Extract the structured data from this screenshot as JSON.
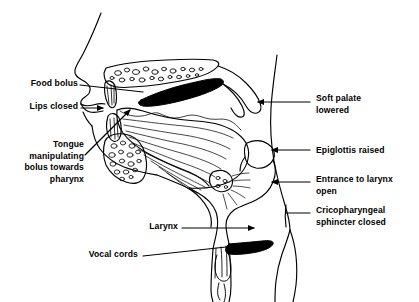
{
  "diagram": {
    "type": "anatomical-line-drawing",
    "view": "midsagittal (side profile, facing left)",
    "stroke_color": "#000000",
    "fill_color": "#000000",
    "background_color": "#ffffff"
  },
  "labels": {
    "food_bolus": "Food bolus",
    "lips_closed": "Lips closed",
    "tongue": "Tongue\nmanipulating\nbolus towards\npharynx",
    "larynx": "Larynx",
    "vocal_cords": "Vocal cords",
    "soft_palate": "Soft palate\nlowered",
    "epiglottis": "Epiglottis raised",
    "entrance_larynx": "Entrance to larynx\nopen",
    "cricopharyngeal": "Cricopharyngeal\nsphincter closed"
  },
  "structures": [
    {
      "name": "nose-profile",
      "side": "left"
    },
    {
      "name": "hard-palate",
      "texture": "stippled-bone"
    },
    {
      "name": "food-bolus",
      "fill": "solid-black"
    },
    {
      "name": "upper-lip",
      "side": "left"
    },
    {
      "name": "lower-lip",
      "side": "left"
    },
    {
      "name": "upper-teeth"
    },
    {
      "name": "lower-teeth"
    },
    {
      "name": "mandible",
      "texture": "stippled-bone"
    },
    {
      "name": "tongue-body",
      "texture": "muscle-striations"
    },
    {
      "name": "soft-palate-uvula"
    },
    {
      "name": "epiglottis"
    },
    {
      "name": "hyoid-bone",
      "texture": "stippled-bone"
    },
    {
      "name": "pharyngeal-wall"
    },
    {
      "name": "larynx"
    },
    {
      "name": "trachea",
      "texture": "cartilage-rings"
    },
    {
      "name": "vocal-cords",
      "fill": "solid-black"
    },
    {
      "name": "esophagus"
    },
    {
      "name": "neck-profile",
      "side": "right"
    },
    {
      "name": "cervical-spine-line"
    }
  ],
  "leader_lines": [
    {
      "for": "food_bolus",
      "style": "plain-line",
      "direction": "right"
    },
    {
      "for": "lips_closed",
      "style": "arrow",
      "direction": "right"
    },
    {
      "for": "tongue",
      "style": "arrow",
      "direction": "up-right"
    },
    {
      "for": "larynx",
      "style": "arrow",
      "direction": "right"
    },
    {
      "for": "vocal_cords",
      "style": "plain-line",
      "direction": "up-right"
    },
    {
      "for": "soft_palate",
      "style": "arrow",
      "direction": "left"
    },
    {
      "for": "epiglottis",
      "style": "arrow",
      "direction": "left"
    },
    {
      "for": "entrance_larynx",
      "style": "arrow",
      "direction": "left"
    },
    {
      "for": "cricopharyngeal",
      "style": "plain-line",
      "direction": "left"
    }
  ]
}
